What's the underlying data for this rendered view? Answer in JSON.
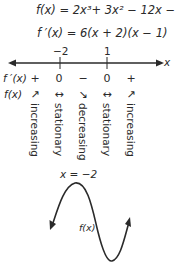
{
  "equations": {
    "f": "f(x) = 2x³+ 3x² − 12x − 4",
    "f_prime": "f ′(x) = 6(x + 2)(x − 1)"
  },
  "number_line": {
    "axis_label": "x",
    "ticks": [
      {
        "label": "−2",
        "x": 60
      },
      {
        "label": "1",
        "x": 107
      }
    ]
  },
  "sign_chart": {
    "f_prime_label": "f ′(x)",
    "f_label": "f(x)",
    "columns": [
      {
        "sign": "+",
        "arrow": "↗",
        "behavior": "increasing"
      },
      {
        "sign": "0",
        "arrow": "↔",
        "behavior": "stationary"
      },
      {
        "sign": "−",
        "arrow": "↘",
        "behavior": "decreasing"
      },
      {
        "sign": "0",
        "arrow": "↔",
        "behavior": "stationary"
      },
      {
        "sign": "+",
        "arrow": "↗",
        "behavior": "increasing"
      }
    ]
  },
  "sketch": {
    "max_label": "x = −2",
    "curve_label": "f(x)",
    "stroke_color": "#2a2a2a"
  }
}
